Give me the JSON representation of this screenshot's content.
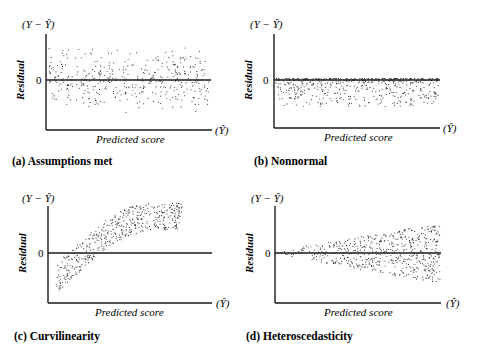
{
  "figure": {
    "common": {
      "y_axis_top_label": "(Y − Ŷ)",
      "y_axis_label": "Residual",
      "zero_tick": "0",
      "x_axis_label": "Predicted score",
      "x_axis_end_label": "(Ŷ)"
    },
    "panels": [
      {
        "id": "a",
        "caption": "(a)  Assumptions  met",
        "pattern": "uniform band centered on zero"
      },
      {
        "id": "b",
        "caption": "(b)  Nonnormal",
        "pattern": "dense near zero, sparse below, none above"
      },
      {
        "id": "c",
        "caption": "(c)  Curvilinearity",
        "pattern": "curved band rising from below zero to above zero"
      },
      {
        "id": "d",
        "caption": "(d)  Heteroscedasticity",
        "pattern": "fan shape widening with predicted score"
      }
    ]
  },
  "colors": {
    "ink": "#1a1a1a",
    "background": "#ffffff"
  }
}
